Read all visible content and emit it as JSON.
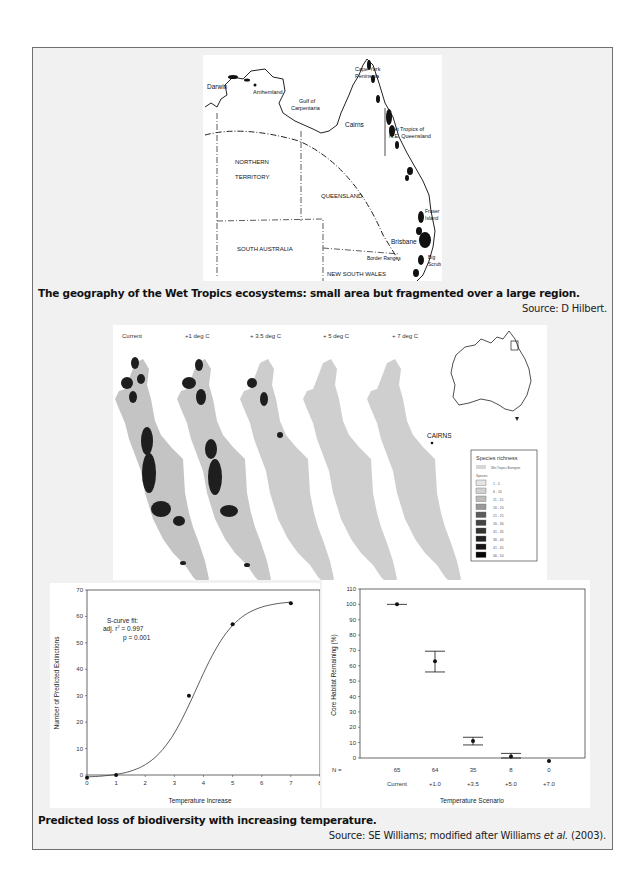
{
  "figure1": {
    "caption": "The geography of the Wet Tropics ecosystems: small area but fragmented over a large region.",
    "source": "Source: D Hilbert.",
    "map_labels": {
      "darwin": "Darwin",
      "arnhemland": "Arnhemland",
      "gulf1": "Gulf of",
      "gulf2": "Carpentaria",
      "cape1": "Cape York",
      "cape2": "Peninsula",
      "cairns": "Cairns",
      "wet1": "Wet Tropics of",
      "wet2": "N.E. Queensland",
      "nt1": "NORTHERN",
      "nt2": "TERRITORY",
      "qld": "QUEENSLAND",
      "fraser1": "Fraser",
      "fraser2": "Island",
      "sa": "SOUTH AUSTRALIA",
      "brisbane": "Brisbane",
      "border": "Border Ranges",
      "big1": "Big",
      "big2": "Scrub",
      "nsw": "NEW SOUTH WALES"
    }
  },
  "figure2": {
    "panels": [
      "Current",
      "+1 deg C",
      "+ 3.5 deg C",
      "+ 5 deg C",
      "+ 7 deg C"
    ],
    "city_label": "CAIRNS",
    "legend": {
      "title": "Species richness",
      "region_label": "Wet Tropics Bioregion",
      "species_heading": "Species",
      "classes": [
        {
          "label": "1 - 5",
          "color": "#e4e4e4"
        },
        {
          "label": "6 - 10",
          "color": "#d2d2d2"
        },
        {
          "label": "11 - 15",
          "color": "#bdbdbd"
        },
        {
          "label": "16 - 20",
          "color": "#9a9a9a"
        },
        {
          "label": "21 - 25",
          "color": "#5a5a5a"
        },
        {
          "label": "26 - 30",
          "color": "#444444"
        },
        {
          "label": "31 - 35",
          "color": "#333333"
        },
        {
          "label": "36 - 40",
          "color": "#222222"
        },
        {
          "label": "41 - 45",
          "color": "#151515"
        },
        {
          "label": "46 - 50",
          "color": "#050505"
        }
      ]
    }
  },
  "figure3": {
    "caption": "Predicted loss of biodiversity with increasing temperature.",
    "source_prefix": "Source: SE Williams; modified after Williams ",
    "source_italic": "et al.",
    "source_suffix": " (2003).",
    "fit_line1": "S-curve fit:",
    "fit_line2": "adj. r",
    "fit_sup": "2",
    "fit_line2b": " = 0.997",
    "fit_line3": "p = 0.001",
    "n_label": "N ="
  },
  "chart_data": [
    {
      "type": "line",
      "title": "",
      "xlabel": "Temperature Increase",
      "ylabel": "Number of Predicted Extinctions",
      "x": [
        0,
        1,
        3.5,
        5,
        7
      ],
      "values": [
        -1,
        0,
        30,
        57,
        65
      ],
      "xlim": [
        0,
        8
      ],
      "ylim": [
        0,
        70
      ],
      "xticks": [
        "0",
        "1",
        "2",
        "3",
        "4",
        "5",
        "6",
        "7",
        "8"
      ],
      "yticks": [
        "0",
        "10",
        "20",
        "30",
        "40",
        "50",
        "60",
        "70"
      ],
      "annotation": "S-curve fit: adj. r2 = 0.997, p = 0.001",
      "grid": false
    },
    {
      "type": "scatter",
      "title": "",
      "xlabel": "Temperature Scenario",
      "ylabel": "Core Habitat Remaining (%)",
      "categories": [
        "Current",
        "+1.0",
        "+3.5",
        "+5.0",
        "+7.0"
      ],
      "n": [
        "65",
        "64",
        "35",
        "8",
        "0"
      ],
      "values": [
        100,
        63,
        11,
        1,
        -2
      ],
      "error_low": [
        100,
        56,
        8.5,
        0,
        -2
      ],
      "error_high": [
        100,
        69.5,
        13.5,
        3,
        -2
      ],
      "ylim": [
        0,
        110
      ],
      "yticks": [
        "0",
        "10",
        "20",
        "30",
        "40",
        "50",
        "60",
        "70",
        "80",
        "90",
        "100",
        "110"
      ],
      "grid": false
    }
  ]
}
